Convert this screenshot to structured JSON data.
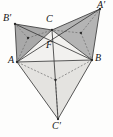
{
  "figure": {
    "name": "fermat-point-construction",
    "width": 113,
    "height": 137,
    "background_color": "#fdfdfc"
  },
  "labels": {
    "A": "A",
    "B": "B",
    "C": "C",
    "F": "F",
    "A_prime": "A′",
    "B_prime": "B′",
    "C_prime": "C′"
  },
  "colors": {
    "stroke": "#3a3a3a",
    "dashed_stroke": "#6d6d6d",
    "fill_upper_left": "#a9a9a9",
    "fill_upper_right": "#b4b4b4",
    "fill_lower": "#e4e3e0",
    "fill_inner": "#f2f1ef",
    "point_fill": "#2b2b2b",
    "label_color": "#151515"
  },
  "chart_data": {
    "type": "diagram",
    "points": {
      "A": {
        "x": 17,
        "y": 62,
        "label": "A"
      },
      "B": {
        "x": 92,
        "y": 60,
        "label": "B"
      },
      "C": {
        "x": 52,
        "y": 30,
        "label": "C"
      },
      "F": {
        "x": 52.5,
        "y": 45,
        "label": "F"
      },
      "Ap": {
        "x": 100,
        "y": 9,
        "label": "A′"
      },
      "Bp": {
        "x": 15,
        "y": 24,
        "label": "B′"
      },
      "Cp": {
        "x": 58,
        "y": 119,
        "label": "C′"
      },
      "Ga": {
        "x": 81,
        "y": 33,
        "label": "centroid-BCA′"
      },
      "Gb": {
        "x": 28,
        "y": 38,
        "label": "centroid-ACB′"
      },
      "Gc": {
        "x": 55.5,
        "y": 80,
        "label": "centroid-ABC′"
      }
    },
    "polygons": [
      {
        "name": "triangle-ACB-prime",
        "vertices": [
          "A",
          "C",
          "Bp"
        ],
        "fill": "#a9a9a9"
      },
      {
        "name": "triangle-BCA-prime",
        "vertices": [
          "B",
          "C",
          "Ap"
        ],
        "fill": "#b4b4b4"
      },
      {
        "name": "triangle-ABC-prime",
        "vertices": [
          "A",
          "B",
          "Cp"
        ],
        "fill": "#e4e3e0"
      },
      {
        "name": "triangle-ABC",
        "vertices": [
          "A",
          "B",
          "C"
        ],
        "fill": "#f2f1ef"
      }
    ],
    "segments": [
      {
        "name": "side-AB",
        "from": "A",
        "to": "B",
        "style": "solid"
      },
      {
        "name": "side-BC",
        "from": "B",
        "to": "C",
        "style": "solid"
      },
      {
        "name": "side-CA",
        "from": "C",
        "to": "A",
        "style": "solid"
      },
      {
        "name": "side-A-Bprime",
        "from": "A",
        "to": "Bp",
        "style": "solid"
      },
      {
        "name": "side-Bprime-C",
        "from": "Bp",
        "to": "C",
        "style": "solid"
      },
      {
        "name": "side-C-Aprime",
        "from": "C",
        "to": "Ap",
        "style": "solid"
      },
      {
        "name": "side-Aprime-B",
        "from": "Ap",
        "to": "B",
        "style": "solid"
      },
      {
        "name": "side-A-Cprime",
        "from": "A",
        "to": "Cp",
        "style": "solid"
      },
      {
        "name": "side-Cprime-B",
        "from": "Cp",
        "to": "B",
        "style": "solid"
      },
      {
        "name": "cevian-A-Aprime",
        "from": "A",
        "to": "Ap",
        "style": "solid"
      },
      {
        "name": "cevian-B-Bprime",
        "from": "B",
        "to": "Bp",
        "style": "solid"
      },
      {
        "name": "cevian-C-Cprime",
        "from": "C",
        "to": "Cp",
        "style": "solid"
      },
      {
        "name": "median-Ga-B",
        "from": "Ga",
        "to": "B",
        "style": "dashed"
      },
      {
        "name": "median-Ga-C",
        "from": "Ga",
        "to": "C",
        "style": "dashed"
      },
      {
        "name": "median-Ga-Aprime",
        "from": "Ga",
        "to": "Ap",
        "style": "dashed"
      },
      {
        "name": "median-Gb-A",
        "from": "Gb",
        "to": "A",
        "style": "dashed"
      },
      {
        "name": "median-Gb-C",
        "from": "Gb",
        "to": "C",
        "style": "dashed"
      },
      {
        "name": "median-Gb-Bprime",
        "from": "Gb",
        "to": "Bp",
        "style": "dashed"
      },
      {
        "name": "median-Gc-A",
        "from": "Gc",
        "to": "A",
        "style": "dashed"
      },
      {
        "name": "median-Gc-B",
        "from": "Gc",
        "to": "B",
        "style": "dashed"
      },
      {
        "name": "median-Gc-Cprime",
        "from": "Gc",
        "to": "Cp",
        "style": "dashed"
      }
    ],
    "marked_points": [
      "A",
      "B",
      "C",
      "Ap",
      "Bp",
      "Cp",
      "Ga",
      "Gb",
      "Gc"
    ]
  },
  "label_positions": {
    "A": {
      "left": 8,
      "top": 55
    },
    "B": {
      "left": 95,
      "top": 53
    },
    "C": {
      "left": 46,
      "top": 14
    },
    "F": {
      "left": 46,
      "top": 40
    },
    "A_prime": {
      "left": 97,
      "top": 0
    },
    "B_prime": {
      "left": 3,
      "top": 13
    },
    "C_prime": {
      "left": 52,
      "top": 121
    }
  }
}
